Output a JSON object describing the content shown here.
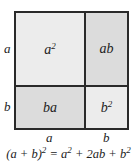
{
  "colors": {
    "a2": "#ececec",
    "ab": "#dcdcdc",
    "ba": "#dcdcdc",
    "b2": "#ececec",
    "border": "#2a2a2a"
  },
  "cells": {
    "a2": {
      "base": "a",
      "exp": "2"
    },
    "ab": {
      "text": "ab"
    },
    "ba": {
      "text": "ba"
    },
    "b2": {
      "base": "b",
      "exp": "2"
    }
  },
  "side_labels": {
    "left_top": "a",
    "left_bottom": "b",
    "bottom_left": "a",
    "bottom_right": "b"
  },
  "equation": {
    "lhs_base": "(a + b)",
    "lhs_exp": "2",
    "mid": " = a",
    "mid_exp": "2",
    "rest": " + 2ab + b",
    "rest_exp": "2"
  }
}
